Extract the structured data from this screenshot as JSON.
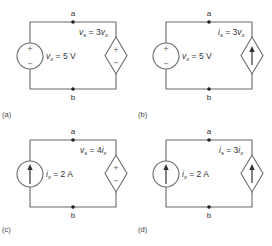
{
  "panels": [
    {
      "id": "a",
      "caption": "(a)",
      "node_top": "a",
      "node_bottom": "b",
      "independent_source": {
        "type": "voltage",
        "var": "v",
        "sub": "x",
        "value": " = 5 V",
        "plus": "+",
        "minus": "−"
      },
      "dependent_source": {
        "type": "voltage",
        "var": "v",
        "sub": "s",
        "expr": " = 3",
        "ctrl_var": "v",
        "ctrl_sub": "x",
        "plus": "+",
        "minus": "−"
      }
    },
    {
      "id": "b",
      "caption": "(b)",
      "node_top": "a",
      "node_bottom": "b",
      "independent_source": {
        "type": "voltage",
        "var": "v",
        "sub": "x",
        "value": " = 5 V",
        "plus": "+",
        "minus": "−"
      },
      "dependent_source": {
        "type": "current",
        "var": "i",
        "sub": "s",
        "expr": " = 3",
        "ctrl_var": "v",
        "ctrl_sub": "x",
        "arrow": "up"
      }
    },
    {
      "id": "c",
      "caption": "(c)",
      "node_top": "a",
      "node_bottom": "b",
      "independent_source": {
        "type": "current",
        "var": "i",
        "sub": "x",
        "value": " = 2 A",
        "arrow": "up"
      },
      "dependent_source": {
        "type": "voltage",
        "var": "v",
        "sub": "s",
        "expr": " = 4",
        "ctrl_var": "i",
        "ctrl_sub": "x",
        "plus": "+",
        "minus": "−"
      }
    },
    {
      "id": "d",
      "caption": "(d)",
      "node_top": "a",
      "node_bottom": "b",
      "independent_source": {
        "type": "current",
        "var": "i",
        "sub": "x",
        "value": " = 2 A",
        "arrow": "up"
      },
      "dependent_source": {
        "type": "current",
        "var": "i",
        "sub": "s",
        "expr": " = 3",
        "ctrl_var": "i",
        "ctrl_sub": "x",
        "arrow": "up"
      }
    }
  ]
}
